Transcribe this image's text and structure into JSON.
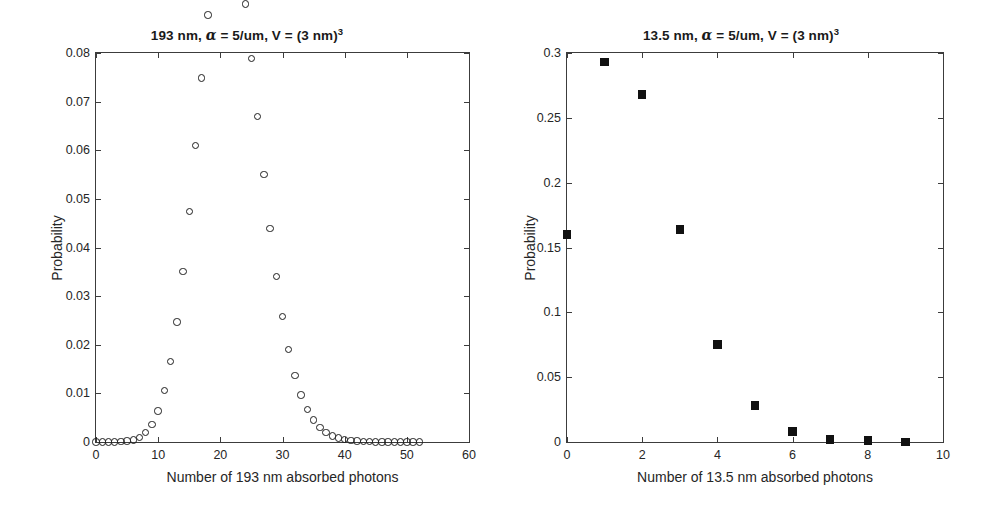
{
  "figure": {
    "background": "#ffffff",
    "axis_color": "#3c3c3c",
    "marker_color": "#1e1e1e",
    "width": 988,
    "height": 517
  },
  "panels": [
    {
      "id": "left",
      "title_parts": {
        "prefix": "193 nm, ",
        "alpha": "α",
        "middle": " = 5/um, V = (3 nm)",
        "exponent": "3"
      },
      "title_text": "193 nm, α = 5/um, V = (3 nm)³"
    },
    {
      "id": "right",
      "title_parts": {
        "prefix": "13.5 nm, ",
        "alpha": "α",
        "middle": " = 5/um, V = (3 nm)",
        "exponent": "3"
      },
      "title_text": "13.5 nm, α = 5/um, V = (3 nm)³"
    }
  ],
  "chart_data": [
    {
      "type": "scatter",
      "panel": "left",
      "title": "193 nm, α = 5/um, V = (3 nm)³",
      "xlabel": "Number of 193 nm absorbed photons",
      "ylabel": "Probability",
      "marker": "open-circle",
      "xlim": [
        0,
        60
      ],
      "ylim": [
        0,
        0.08
      ],
      "xticks": [
        0,
        10,
        20,
        30,
        40,
        50,
        60
      ],
      "xticklabels": [
        "0",
        "10",
        "20",
        "30",
        "40",
        "50",
        "60"
      ],
      "yticks": [
        0,
        0.01,
        0.02,
        0.03,
        0.04,
        0.05,
        0.06,
        0.07,
        0.08
      ],
      "yticklabels": [
        "0",
        "0.01",
        "0.02",
        "0.03",
        "0.04",
        "0.05",
        "0.06",
        "0.07",
        "0.08"
      ],
      "grid": false,
      "legend": null,
      "distribution": "Poisson(lambda=26)",
      "x": [
        0,
        1,
        2,
        3,
        4,
        5,
        6,
        7,
        8,
        9,
        10,
        11,
        12,
        13,
        14,
        15,
        16,
        17,
        18,
        19,
        20,
        21,
        22,
        23,
        24,
        25,
        26,
        27,
        28,
        29,
        30,
        31,
        32,
        33,
        34,
        35,
        36,
        37,
        38,
        39,
        40,
        41,
        42,
        43,
        44,
        45,
        46,
        47,
        48,
        49,
        50,
        51,
        52
      ],
      "y": [
        0.0,
        0.0,
        0.0,
        0.0,
        0.0,
        0.0,
        0.0,
        0.0,
        0.0001,
        0.0002,
        0.0005,
        0.0012,
        0.0026,
        0.0052,
        0.0097,
        0.0168,
        0.0272,
        0.0416,
        0.0601,
        0.0822,
        0.1069,
        0.1324,
        0.1564,
        0.1768,
        0.1915,
        0.1991,
        0.1991,
        0.1917,
        0.178,
        0.1595,
        0.1382,
        0.1159,
        0.0942,
        0.0742,
        0.0567,
        0.0421,
        0.0304,
        0.0214,
        0.0146,
        0.0098,
        0.0064,
        0.004,
        0.0025,
        0.0015,
        0.0009,
        0.0005,
        0.0003,
        0.0002,
        0.0001,
        0.0001,
        0.0,
        0.0,
        0.0
      ],
      "y_scaled_note": "plotted probabilities (max ≈ 0.078 at x = 25 and 26)",
      "values": [
        0.0,
        0.0,
        0.0,
        0.0,
        0.0001,
        0.0002,
        0.0004,
        0.0009,
        0.0019,
        0.0036,
        0.0064,
        0.0106,
        0.0166,
        0.0247,
        0.0351,
        0.0474,
        0.061,
        0.0749,
        0.0878,
        0.0982,
        0.1049,
        0.1071,
        0.1049,
        0.099,
        0.0901,
        0.0789,
        0.0669,
        0.055,
        0.0439,
        0.0341,
        0.0258,
        0.019,
        0.0137,
        0.0097,
        0.0067,
        0.0045,
        0.003,
        0.0019,
        0.0012,
        0.0008,
        0.0005,
        0.0003,
        0.0002,
        0.0001,
        0.0001,
        0.0,
        0.0,
        0.0,
        0.0,
        0.0,
        0.0,
        0.0,
        0.0
      ]
    },
    {
      "type": "scatter",
      "panel": "right",
      "title": "13.5 nm, α = 5/um, V = (3 nm)³",
      "xlabel": "Number of 13.5 nm absorbed photons",
      "ylabel": "Probability",
      "marker": "filled-square",
      "xlim": [
        0,
        10
      ],
      "ylim": [
        0,
        0.3
      ],
      "xticks": [
        0,
        2,
        4,
        6,
        8,
        10
      ],
      "xticklabels": [
        "0",
        "2",
        "4",
        "6",
        "8",
        "10"
      ],
      "yticks": [
        0,
        0.05,
        0.1,
        0.15,
        0.2,
        0.25,
        0.3
      ],
      "yticklabels": [
        "0",
        "0.05",
        "0.1",
        "0.15",
        "0.2",
        "0.25",
        "0.3"
      ],
      "grid": false,
      "legend": null,
      "distribution": "Poisson(lambda≈1.83)",
      "x": [
        0,
        1,
        2,
        3,
        4,
        5,
        6,
        7,
        8,
        9
      ],
      "values": [
        0.16,
        0.293,
        0.268,
        0.164,
        0.075,
        0.028,
        0.008,
        0.002,
        0.001,
        0.0
      ]
    }
  ]
}
